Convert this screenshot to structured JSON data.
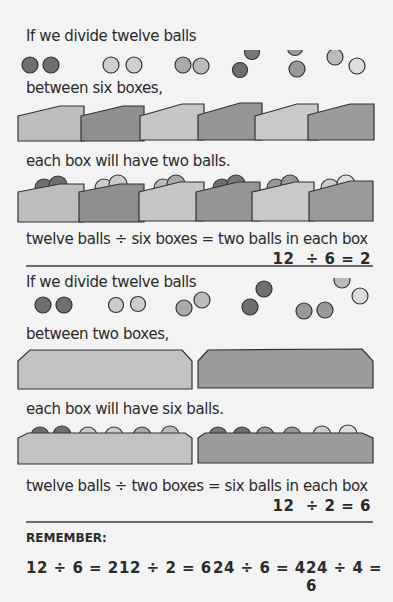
{
  "section1": {
    "line1": "If we divide twelve balls",
    "line2": "between six boxes,",
    "line3": "each box will have two balls.",
    "words": "twelve balls ÷ six boxes = two balls in each box",
    "equation": "12  ÷ 6 = 2",
    "box_count": 6,
    "balls_per_box": 2
  },
  "section2": {
    "line1": "If we divide twelve balls",
    "line2": "between two boxes,",
    "line3": "each box will have six balls.",
    "words": "twelve balls ÷ two boxes = six balls in each box",
    "equation": "12  ÷ 2 = 6",
    "box_count": 2,
    "balls_per_box": 6
  },
  "remember": {
    "label": "REMEMBER:",
    "facts": [
      "12 ÷ 6 = 2",
      "12 ÷ 2 = 6",
      "24 ÷ 6 = 4",
      "24 ÷ 4 = 6"
    ]
  }
}
